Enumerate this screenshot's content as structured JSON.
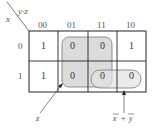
{
  "kmap": {
    "row_var": "x",
    "col_var": "y·z",
    "col_headers": [
      "00",
      "01",
      "11",
      "10"
    ],
    "row_headers": [
      "0",
      "1"
    ],
    "cells": [
      [
        "1",
        "0",
        "0",
        "1"
      ],
      [
        "1",
        "0",
        "0",
        "0"
      ]
    ],
    "groups": [
      {
        "label": "z",
        "cells": "columns 01 and 11, both rows"
      },
      {
        "label": "x̄ + ȳ",
        "cells": "row 1, columns 11 and 10"
      }
    ]
  },
  "annotations": {
    "z_label": "z",
    "xy_label_x": "x",
    "xy_plus": "+",
    "xy_label_y": "y"
  },
  "colors": {
    "grid": "#222222",
    "group_fill": "#d9d9d9",
    "group_stroke": "#666666",
    "text": "#333333"
  }
}
